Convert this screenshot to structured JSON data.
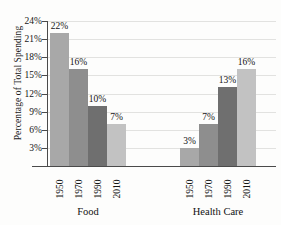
{
  "chart_data": {
    "type": "bar",
    "title": "",
    "xlabel": "",
    "ylabel": "Percentage of Total Spending",
    "ylim": [
      0,
      24
    ],
    "ytick_labels": [
      "3%",
      "6%",
      "9%",
      "12%",
      "15%",
      "18%",
      "21%",
      "24%"
    ],
    "ytick_values": [
      3,
      6,
      9,
      12,
      15,
      18,
      21,
      24
    ],
    "grid": true,
    "legend": "none",
    "categories": [
      "1950",
      "1970",
      "1990",
      "2010"
    ],
    "groups": [
      {
        "name": "Food",
        "categories": [
          "1950",
          "1970",
          "1990",
          "2010"
        ],
        "values": [
          22,
          16,
          10,
          7
        ],
        "value_labels": [
          "22%",
          "16%",
          "10%",
          "7%"
        ]
      },
      {
        "name": "Health Care",
        "categories": [
          "1950",
          "1970",
          "1990",
          "2010"
        ],
        "values": [
          3,
          7,
          13,
          16
        ],
        "value_labels": [
          "3%",
          "7%",
          "13%",
          "16%"
        ]
      }
    ],
    "series_colors": {
      "1950": "#a8a8a8",
      "1970": "#8e8e8e",
      "1990": "#6f6f6f",
      "2010": "#c2c2c2"
    },
    "axis_color": "#4a4a4a",
    "grid_color": "#e2e2e0",
    "background": "#fdfdfc"
  }
}
